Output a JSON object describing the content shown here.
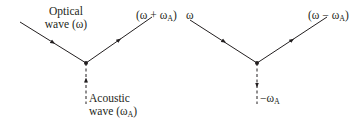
{
  "diagrams": [
    {
      "name": "anti-stokes-sum",
      "incoming_label_line1": "Optical",
      "incoming_label_line2": "wave (ω)",
      "outgoing_label_main": "(ω + ω",
      "outgoing_label_sub": "A",
      "outgoing_label_close": ")",
      "acoustic_label_line1": "Acoustic",
      "acoustic_label_line2_main": "wave (ω",
      "acoustic_label_line2_sub": "A",
      "acoustic_label_line2_close": ")",
      "acoustic_direction": "up"
    },
    {
      "name": "stokes-difference",
      "incoming_label": "ω",
      "outgoing_label_main": "(ω − ω",
      "outgoing_label_sub": "A",
      "outgoing_label_close": ")",
      "acoustic_label_main": "−ω",
      "acoustic_label_sub": "A",
      "acoustic_direction": "down"
    }
  ],
  "colors": {
    "line": "#231f20",
    "background": "#ffffff"
  }
}
